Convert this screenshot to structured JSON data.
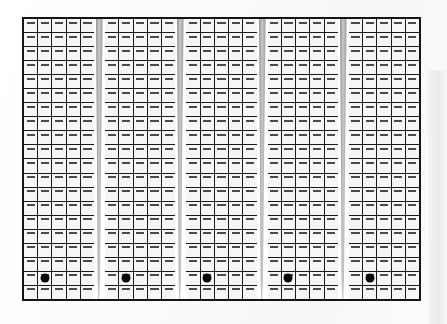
{
  "scene": {
    "title": "Building facade grid",
    "description": "Grid of window panels on a tower facade",
    "background_color": "#fdfdfc"
  },
  "facade": {
    "grid_border_color": "#141414",
    "cell_fill_color": "#f6f6f4",
    "cell_line_color": "#1a1a1a",
    "blind_color": "#4a4a4a",
    "marker_color": "#0a0a0a",
    "seam_color": "#b4b4b2",
    "rows": 20,
    "blocks": 5,
    "columns_per_block": 5,
    "total_columns": 25,
    "seam_count": 4,
    "blind_label": "window-louver",
    "markers": [
      {
        "block": 0,
        "column": 1,
        "row": 18,
        "label": "marker-1"
      },
      {
        "block": 1,
        "column": 1,
        "row": 18,
        "label": "marker-2"
      },
      {
        "block": 2,
        "column": 1,
        "row": 18,
        "label": "marker-3"
      },
      {
        "block": 3,
        "column": 1,
        "row": 18,
        "label": "marker-4"
      },
      {
        "block": 4,
        "column": 1,
        "row": 18,
        "label": "marker-5"
      }
    ]
  }
}
